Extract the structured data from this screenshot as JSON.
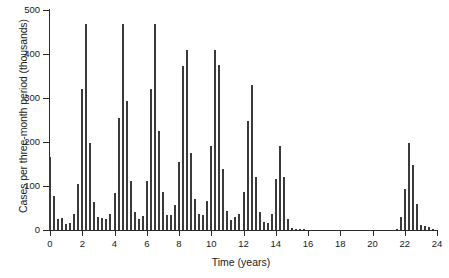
{
  "chart_data": {
    "type": "bar",
    "title": "",
    "xlabel": "Time (years)",
    "ylabel": "Cases per three-month period (thousands)",
    "xlim": [
      0,
      24
    ],
    "ylim": [
      0,
      500
    ],
    "xticks": [
      0,
      2,
      4,
      6,
      8,
      10,
      12,
      14,
      16,
      18,
      20,
      22,
      24
    ],
    "xticklabels": [
      "0",
      "2",
      "4",
      "6",
      "8",
      "10",
      "12",
      "14",
      "16",
      "18",
      "20",
      "22",
      "24"
    ],
    "yticks": [
      0,
      100,
      200,
      300,
      400,
      500
    ],
    "yticklabels": [
      "0",
      "100",
      "200",
      "300",
      "400",
      "500"
    ],
    "grid": false,
    "legend": null,
    "bar_color": "#3a3a3a",
    "bar_width_years": 0.12,
    "x": [
      0.0,
      0.25,
      0.5,
      0.75,
      1.0,
      1.25,
      1.5,
      1.75,
      2.0,
      2.25,
      2.5,
      2.75,
      3.0,
      3.25,
      3.5,
      3.75,
      4.0,
      4.25,
      4.5,
      4.75,
      5.0,
      5.25,
      5.5,
      5.75,
      6.0,
      6.25,
      6.5,
      6.75,
      7.0,
      7.25,
      7.5,
      7.75,
      8.0,
      8.25,
      8.5,
      8.75,
      9.0,
      9.25,
      9.5,
      9.75,
      10.0,
      10.25,
      10.5,
      10.75,
      11.0,
      11.25,
      11.5,
      11.75,
      12.0,
      12.25,
      12.5,
      12.75,
      13.0,
      13.25,
      13.5,
      13.75,
      14.0,
      14.25,
      14.5,
      14.75,
      15.0,
      15.25,
      15.5,
      15.75,
      16.0,
      16.25,
      16.5,
      16.75,
      17.0,
      17.25,
      17.5,
      17.75,
      18.0,
      18.25,
      18.5,
      18.75,
      19.0,
      19.25,
      19.5,
      19.75,
      20.0,
      20.25,
      20.5,
      20.75,
      21.0,
      21.25,
      21.5,
      21.75,
      22.0,
      22.25,
      22.5,
      22.75,
      23.0,
      23.25,
      23.5,
      23.75
    ],
    "values": [
      165,
      78,
      25,
      27,
      13,
      15,
      36,
      104,
      320,
      469,
      198,
      64,
      30,
      27,
      24,
      36,
      85,
      255,
      469,
      293,
      112,
      42,
      26,
      31,
      111,
      320,
      469,
      224,
      86,
      35,
      35,
      57,
      155,
      373,
      408,
      174,
      70,
      36,
      35,
      65,
      192,
      408,
      374,
      139,
      44,
      22,
      30,
      36,
      87,
      247,
      330,
      121,
      40,
      18,
      17,
      36,
      117,
      190,
      120,
      25,
      4,
      2,
      1,
      1,
      0,
      0,
      0,
      0,
      0,
      0,
      0,
      0,
      0,
      0,
      0,
      0,
      0,
      0,
      0,
      0,
      0,
      0,
      0,
      0,
      0,
      0,
      3,
      29,
      93,
      197,
      148,
      58,
      12,
      8,
      6,
      1
    ]
  }
}
